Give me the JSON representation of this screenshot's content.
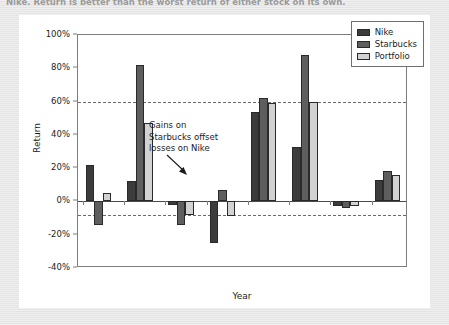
{
  "page": {
    "top_caption": "Nike. Return is better than the worst return of either stock on its own."
  },
  "legend": {
    "items": [
      {
        "label": "Nike",
        "color": "#3c3c3c"
      },
      {
        "label": "Starbucks",
        "color": "#5e5e5e"
      },
      {
        "label": "Portfolio",
        "color": "#d2d2d2"
      }
    ]
  },
  "annotation": {
    "line1": "Gains on",
    "line2": "Starbucks offset",
    "line3": "losses on Nike"
  },
  "chart_data": {
    "type": "bar",
    "title": "",
    "xlabel": "Year",
    "ylabel": "Return",
    "categories": [
      "1999",
      "2000",
      "2001",
      "2002",
      "2003",
      "2004",
      "2005",
      "2006"
    ],
    "series": [
      {
        "name": "Nike",
        "color": "#3c3c3c",
        "values": [
          22,
          12,
          -2,
          -25,
          54,
          33,
          -3,
          13
        ]
      },
      {
        "name": "Starbucks",
        "color": "#5e5e5e",
        "values": [
          -14,
          82,
          -14,
          7,
          62,
          88,
          -4,
          18
        ]
      },
      {
        "name": "Portfolio",
        "color": "#d2d2d2",
        "values": [
          5,
          47,
          -8,
          -9,
          59,
          60,
          -3,
          16
        ]
      }
    ],
    "ylim": [
      -40,
      100
    ],
    "yticks": [
      100,
      80,
      60,
      40,
      20,
      0,
      -20,
      -40
    ],
    "ytick_labels": [
      "100%",
      "80%",
      "60%",
      "40%",
      "20%",
      "0%",
      "-20%",
      "-40%"
    ],
    "reference_lines": [
      60,
      -8
    ],
    "grid": false,
    "legend_position": "top-right",
    "value_suffix": "%"
  }
}
